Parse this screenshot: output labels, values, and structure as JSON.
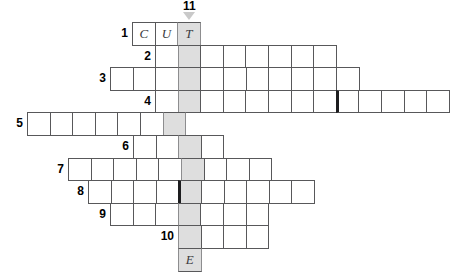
{
  "puzzle": {
    "type": "crossword-skeleton",
    "title": "",
    "geometry": {
      "cell_size": 22.6,
      "grid_left": 27,
      "grid_top": 22,
      "highlight_column_x": 178
    },
    "highlight_column": {
      "number": "11",
      "label": "11",
      "color": "#dedede",
      "arrow_icon": "down-arrow-icon",
      "top_letter": "T",
      "bottom_letter": "E",
      "rows_spanned": 11
    },
    "rows": [
      {
        "number": "1",
        "num_label": "1",
        "start_x": 132,
        "cells": 3,
        "highlight_index": 2,
        "thick_divider_index": -1,
        "letters": [
          "C",
          "U",
          "T"
        ]
      },
      {
        "number": "2",
        "num_label": "2",
        "start_x": 155,
        "cells": 8,
        "highlight_index": 1,
        "thick_divider_index": -1,
        "letters": [
          "",
          "",
          "",
          "",
          "",
          "",
          "",
          ""
        ]
      },
      {
        "number": "3",
        "num_label": "3",
        "start_x": 110,
        "cells": 11,
        "highlight_index": 3,
        "thick_divider_index": -1,
        "letters": [
          "",
          "",
          "",
          "",
          "",
          "",
          "",
          "",
          "",
          "",
          ""
        ]
      },
      {
        "number": "4",
        "num_label": "4",
        "start_x": 155,
        "cells": 13,
        "highlight_index": 1,
        "thick_divider_index": 8,
        "letters": [
          "",
          "",
          "",
          "",
          "",
          "",
          "",
          "",
          "",
          "",
          "",
          "",
          ""
        ]
      },
      {
        "number": "5",
        "num_label": "5",
        "start_x": 27,
        "cells": 7,
        "highlight_index": 6,
        "thick_divider_index": -1,
        "letters": [
          "",
          "",
          "",
          "",
          "",
          "",
          ""
        ]
      },
      {
        "number": "6",
        "num_label": "6",
        "start_x": 133,
        "cells": 4,
        "highlight_index": 2,
        "thick_divider_index": -1,
        "letters": [
          "",
          "",
          "",
          ""
        ]
      },
      {
        "number": "7",
        "num_label": "7",
        "start_x": 68,
        "cells": 9,
        "highlight_index": 5,
        "thick_divider_index": -1,
        "letters": [
          "",
          "",
          "",
          "",
          "",
          "",
          "",
          "",
          ""
        ]
      },
      {
        "number": "8",
        "num_label": "8",
        "start_x": 88,
        "cells": 10,
        "highlight_index": 4,
        "thick_divider_index": 4,
        "letters": [
          "",
          "",
          "",
          "",
          "",
          "",
          "",
          "",
          "",
          ""
        ]
      },
      {
        "number": "9",
        "num_label": "9",
        "start_x": 110,
        "cells": 7,
        "highlight_index": 3,
        "thick_divider_index": -1,
        "letters": [
          "",
          "",
          "",
          "",
          "",
          "",
          ""
        ]
      },
      {
        "number": "10",
        "num_label": "10",
        "start_x": 178,
        "cells": 4,
        "highlight_index": 0,
        "thick_divider_index": -1,
        "letters": [
          "",
          "",
          "",
          ""
        ]
      },
      {
        "number": "11",
        "num_label": "",
        "start_x": 178,
        "cells": 1,
        "highlight_index": 0,
        "thick_divider_index": -1,
        "letters": [
          "E"
        ]
      }
    ]
  }
}
